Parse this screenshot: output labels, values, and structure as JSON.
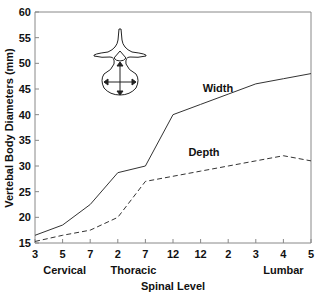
{
  "chart_data": {
    "type": "line",
    "title": "",
    "xlabel": "Spinal Level",
    "ylabel": "Vertebal Body Diameters (mm)",
    "ylim": [
      15,
      60
    ],
    "yticks": [
      15,
      20,
      25,
      30,
      35,
      40,
      45,
      50,
      55,
      60
    ],
    "categories": [
      "3",
      "5",
      "7",
      "2",
      "7",
      "12",
      "12",
      "2",
      "3",
      "4",
      "5"
    ],
    "region_labels": [
      {
        "label": "Cervical",
        "index": 1
      },
      {
        "label": "Thoracic",
        "index": 4
      },
      {
        "label": "Lumbar",
        "index": 9
      }
    ],
    "series": [
      {
        "name": "Width",
        "style": "solid",
        "values": [
          16.5,
          18.5,
          22.5,
          28.7,
          30,
          40,
          42,
          44,
          46,
          47,
          48
        ]
      },
      {
        "name": "Depth",
        "style": "dashed",
        "values": [
          15.3,
          16.5,
          17.5,
          20,
          27,
          28,
          29,
          30,
          31,
          32,
          31
        ]
      }
    ],
    "grid": false,
    "legend": "inline labels",
    "inset_illustration": "vertebra cross-section with width and depth arrows"
  }
}
